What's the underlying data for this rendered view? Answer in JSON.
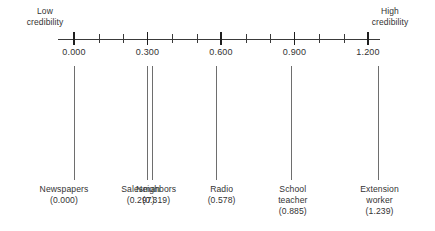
{
  "axis": {
    "low_label": "Low\ncredibility",
    "high_label": "High\ncredibility",
    "major_ticks": [
      "0.000",
      "0.300",
      "0.600",
      "0.900",
      "1.200"
    ],
    "major_values": [
      0.0,
      0.3,
      0.6,
      0.9,
      1.2
    ],
    "minor_values": [
      0.1,
      0.2,
      0.4,
      0.5,
      0.7,
      0.8,
      1.0,
      1.1
    ],
    "range": [
      -0.065,
      1.255
    ]
  },
  "chart_data": {
    "type": "scatter",
    "title": "",
    "subtitle": "",
    "xlabel": "",
    "ylabel": "",
    "orientation": "horizontal-number-line",
    "grid": false,
    "legend": "none",
    "xlim": [
      -0.065,
      1.255
    ],
    "axis_low_annotation": "Low credibility",
    "axis_high_annotation": "High credibility",
    "tick_labels": [
      "0.000",
      "0.300",
      "0.600",
      "0.900",
      "1.200"
    ],
    "categories": [
      "Newspapers",
      "Salesman",
      "Neighbors",
      "Radio",
      "School teacher",
      "Extension worker"
    ],
    "values": [
      0.0,
      0.297,
      0.319,
      0.578,
      0.885,
      1.239
    ],
    "points": [
      {
        "label": "Newspapers",
        "label_line1": "Newspapers",
        "label_line2": "",
        "value": 0.0,
        "value_text": "(0.000)"
      },
      {
        "label": "Salesman",
        "label_line1": "Salesman",
        "label_line2": "",
        "value": 0.297,
        "value_text": "(0.297)"
      },
      {
        "label": "Neighbors",
        "label_line1": "Neighbors",
        "label_line2": "",
        "value": 0.319,
        "value_text": "(0.319)"
      },
      {
        "label": "Radio",
        "label_line1": "Radio",
        "label_line2": "",
        "value": 0.578,
        "value_text": "(0.578)"
      },
      {
        "label": "School teacher",
        "label_line1": "School",
        "label_line2": "teacher",
        "value": 0.885,
        "value_text": "(0.885)"
      },
      {
        "label": "Extension worker",
        "label_line1": "Extension",
        "label_line2": "worker",
        "value": 1.239,
        "value_text": "(1.239)"
      }
    ]
  },
  "labels": {
    "newspapers": "Newspapers\n(0.000)",
    "salesman": "Salesman\n(0.297)",
    "neighbors": "Neighbors\n(0.319)",
    "radio": "Radio\n(0.578)",
    "school_teacher": "School\nteacher\n(0.885)",
    "extension_worker": "Extension\nworker\n(1.239)"
  },
  "colors": {
    "axis": "#3a3a3a",
    "tick_major": "#1f1f1f",
    "marker_line": "#6e6e6e",
    "text": "#333333",
    "background": "#ffffff"
  }
}
